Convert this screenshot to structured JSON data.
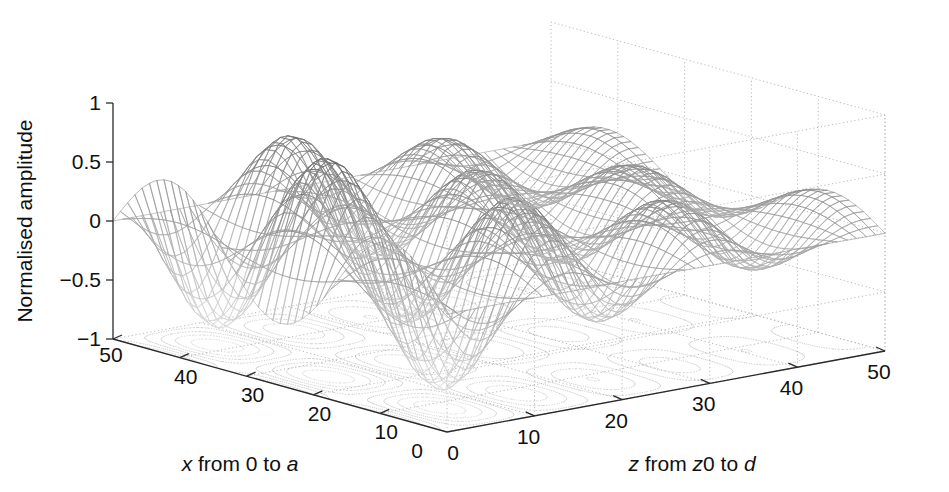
{
  "figure": {
    "background_color": "#ffffff",
    "type": "3d-mesh-surface-with-contour",
    "width": 949,
    "height": 492
  },
  "axes": {
    "z_axis": {
      "name": "vertical-axis",
      "title": "Normalised amplitude",
      "tick_labels": [
        "1",
        "0.5",
        "0",
        "-0.5",
        "-1"
      ],
      "tick_values": [
        1,
        0.5,
        0,
        -0.5,
        -1
      ],
      "range": [
        -1,
        1
      ]
    },
    "x_axis": {
      "name": "depth-left-axis",
      "title_parts": [
        {
          "text": "x",
          "italic": true
        },
        {
          "text": " from 0 to ",
          "italic": false
        },
        {
          "text": "a",
          "italic": true
        }
      ],
      "title_plain": "x from 0 to a",
      "tick_labels": [
        "50",
        "40",
        "30",
        "20",
        "10",
        "0"
      ],
      "tick_values": [
        50,
        40,
        30,
        20,
        10,
        0
      ],
      "range": [
        0,
        50
      ]
    },
    "y_axis": {
      "name": "depth-right-axis",
      "title_parts": [
        {
          "text": "z",
          "italic": true
        },
        {
          "text": " from ",
          "italic": false
        },
        {
          "text": "z",
          "italic": true
        },
        {
          "text": "0 to ",
          "italic": false
        },
        {
          "text": "d",
          "italic": true
        }
      ],
      "title_plain": "z from z0 to d",
      "tick_labels": [
        "0",
        "10",
        "20",
        "30",
        "40",
        "50"
      ],
      "tick_values": [
        0,
        10,
        20,
        30,
        40,
        50
      ],
      "range": [
        0,
        50
      ]
    }
  },
  "chart_data": {
    "type": "surface",
    "title": "",
    "xlabel": "x from 0 to a",
    "ylabel": "z from z0 to d",
    "zlabel": "Normalised amplitude",
    "xlim": [
      0,
      50
    ],
    "ylim": [
      0,
      50
    ],
    "zlim": [
      -1,
      1
    ],
    "grid": true,
    "legend": "none",
    "colormap": "grayscale",
    "mesh_nx": 46,
    "mesh_ny": 46,
    "surface_function": {
      "formula": "A(x,z) = sin(3*pi*x/50) * cos(2*pi*(z+3)/17.5) * exp(-z/34)",
      "x_modes": 3,
      "z_period": 17.5,
      "z_decay_constant": 34
    },
    "peaks": [
      {
        "label": "front-left-main-peak",
        "x": 21,
        "z": 4,
        "amplitude": 1.0
      },
      {
        "label": "back-left-peak",
        "x": 38,
        "z": 3,
        "amplitude": 0.88
      },
      {
        "label": "back-right-peak",
        "x": 36,
        "z": 20,
        "amplitude": 0.9
      },
      {
        "label": "mid-peak",
        "x": 20,
        "z": 20,
        "amplitude": 0.62
      },
      {
        "label": "far-right-peak",
        "x": 30,
        "z": 38,
        "amplitude": 0.35
      }
    ],
    "contour_projection": {
      "enabled": true,
      "plane": "base",
      "levels": [
        -0.9,
        -0.7,
        -0.5,
        -0.3,
        -0.1,
        0.1,
        0.3,
        0.5,
        0.7,
        0.9
      ]
    }
  },
  "colors": {
    "axis": "#2a2a2a",
    "grid": "#b9b9b9",
    "text": "#101010",
    "mesh_dark": "#4a4a4a",
    "mesh_light": "#c9c9c9",
    "contour": "#9a9a9a"
  },
  "projection": {
    "origin": {
      "x": 447,
      "y": 432
    },
    "x_axis_end": {
      "x": 113,
      "y": 339
    },
    "y_axis_end": {
      "x": 885,
      "y": 351
    },
    "z_top": {
      "x": 113,
      "y": 103
    },
    "z_pixel_span": 236
  }
}
